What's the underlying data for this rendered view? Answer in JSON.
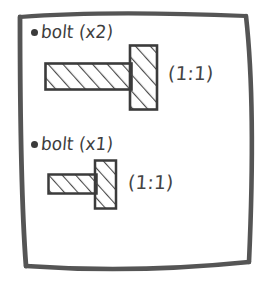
{
  "sheet": {
    "kind": "hand-drawn-sketch-note",
    "border_color": "#555555",
    "ink_color": "#3d3d3d",
    "paper_color": "#ffffff"
  },
  "parts": [
    {
      "bullet": "bullet-dot",
      "label": "bolt (x2)",
      "name": "bolt",
      "quantity_text": "(x2)",
      "scale_note": "(1:1)",
      "drawing": {
        "icon": "bolt-side-view-icon",
        "hatch": "diagonal",
        "shaft": {
          "x": 0,
          "y": 18,
          "w": 86,
          "h": 27
        },
        "head": {
          "x": 86,
          "y": 0,
          "w": 27,
          "h": 65
        }
      }
    },
    {
      "bullet": "bullet-dot",
      "label": "bolt (x1)",
      "name": "bolt",
      "quantity_text": "(x1)",
      "scale_note": "(1:1)",
      "drawing": {
        "icon": "bolt-side-view-icon",
        "hatch": "diagonal",
        "shaft": {
          "x": 0,
          "y": 14,
          "w": 49,
          "h": 20
        },
        "head": {
          "x": 49,
          "y": 0,
          "w": 20,
          "h": 49
        }
      }
    }
  ]
}
